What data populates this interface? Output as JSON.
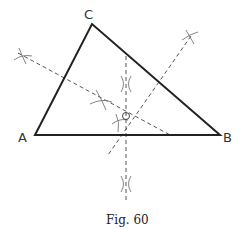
{
  "figure": {
    "caption": "Fig. 60",
    "colors": {
      "triangle": "#222222",
      "construction": "#555555",
      "arcs": "#777777",
      "text": "#333333"
    },
    "vertices": {
      "A": {
        "label": "A",
        "x": 35,
        "y": 135
      },
      "B": {
        "label": "B",
        "x": 220,
        "y": 135
      },
      "C": {
        "label": "C",
        "x": 92,
        "y": 24
      }
    },
    "center": {
      "label": "O",
      "x": 126,
      "y": 116
    },
    "bisectors": [
      {
        "side": "AB",
        "from": [
          126,
          56
        ],
        "to": [
          126,
          200
        ]
      },
      {
        "side": "AC",
        "from": [
          18,
          53
        ],
        "to": [
          172,
          136
        ]
      },
      {
        "side": "BC",
        "from": [
          191,
          36
        ],
        "to": [
          108,
          155
        ]
      }
    ],
    "arc_marks": [
      {
        "x": 22,
        "y": 56
      },
      {
        "x": 102,
        "y": 100
      },
      {
        "x": 126,
        "y": 83
      },
      {
        "x": 126,
        "y": 184
      },
      {
        "x": 190,
        "y": 37
      },
      {
        "x": 120,
        "y": 122
      }
    ]
  }
}
